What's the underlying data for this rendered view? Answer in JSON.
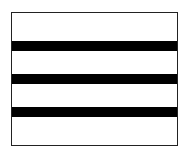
{
  "figure": {
    "shape": "rectangle-with-horizontal-stripes",
    "border_color": "#222222",
    "fill_color": "#ffffff",
    "stripe_color": "#000000",
    "stripe_count": 3,
    "stripes": [
      {
        "top": 29,
        "height": 10
      },
      {
        "top": 62,
        "height": 10
      },
      {
        "top": 95,
        "height": 10
      }
    ]
  }
}
